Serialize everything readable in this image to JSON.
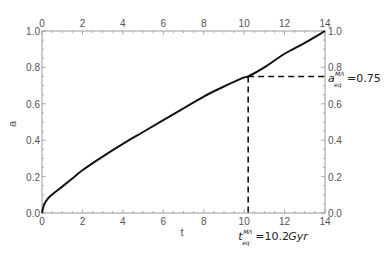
{
  "chart_data": {
    "type": "line",
    "title": "",
    "xlabel": "t",
    "ylabel": "a",
    "xlim": [
      0,
      14
    ],
    "ylim": [
      0,
      1.0
    ],
    "x_ticks": [
      "0",
      "2",
      "4",
      "6",
      "8",
      "10",
      "12",
      "14"
    ],
    "x_ticks_top": [
      "0",
      "2",
      "4",
      "6",
      "8",
      "10",
      "12",
      "14"
    ],
    "y_ticks": [
      "0.0",
      "0.2",
      "0.4",
      "0.6",
      "0.8",
      "1.0"
    ],
    "y_ticks_right": [
      "0.0",
      "0.2",
      "0.4",
      "0.6",
      "0.8",
      "1.0"
    ],
    "grid": false,
    "legend": null,
    "series": [
      {
        "name": "a(t)",
        "color": "#111111",
        "x": [
          0,
          0.1,
          0.3,
          0.6,
          1,
          1.5,
          2,
          3,
          4,
          5,
          6,
          7,
          8,
          9,
          10,
          10.2,
          11,
          12,
          13,
          14
        ],
        "y": [
          0,
          0.045,
          0.08,
          0.11,
          0.145,
          0.19,
          0.235,
          0.31,
          0.38,
          0.445,
          0.51,
          0.575,
          0.64,
          0.695,
          0.745,
          0.75,
          0.8,
          0.875,
          0.935,
          1.0
        ]
      }
    ],
    "annotations": [
      {
        "type": "hline-dashed",
        "y": 0.75,
        "x_from": 10.2,
        "x_to": 14,
        "label_main": "a",
        "label_sub": "eq",
        "label_sup": "MΛ",
        "label_value": "=0.75"
      },
      {
        "type": "vline-dashed",
        "x": 10.2,
        "y_from": 0,
        "y_to": 0.75,
        "label_main": "t",
        "label_sub": "eq",
        "label_sup": "MΛ",
        "label_value": "=10.2",
        "label_unit": "Gyr"
      }
    ]
  },
  "colors": {
    "frame": "#9a9a9a",
    "curve": "#111111",
    "dashed": "#111111",
    "tick_label": "#555555"
  }
}
